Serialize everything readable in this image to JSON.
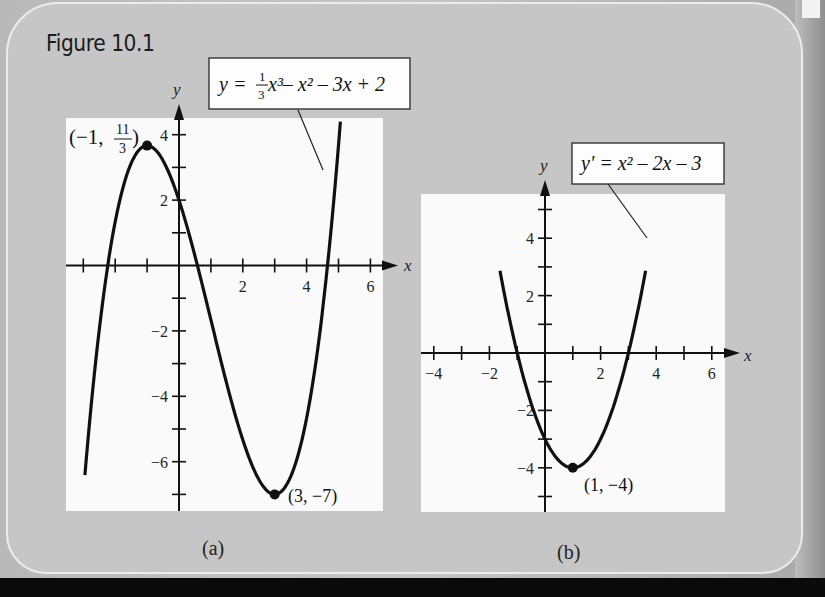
{
  "figure": {
    "title": "Figure 10.1",
    "background_color": "#c6c6c6",
    "panel_color": "#fafafa",
    "curve_color": "#111111"
  },
  "chart_data": [
    {
      "type": "line",
      "panel": "(a)",
      "title": "y = (1/3)x^3 - x^2 - 3x + 2",
      "label_box": {
        "prefix": "y = ",
        "frac_num": "1",
        "frac_den": "3",
        "rest": " x³– x² – 3x + 2"
      },
      "xlabel": "x",
      "ylabel": "y",
      "xlim": [
        -3.5,
        6.6
      ],
      "ylim": [
        -7.6,
        4.5
      ],
      "x_tick_labels": [
        "2",
        "4",
        "6"
      ],
      "y_tick_labels": [
        "4",
        "2",
        "−2",
        "−4",
        "−6"
      ],
      "x_ticks": [
        -3,
        -2,
        -1,
        1,
        2,
        3,
        4,
        5,
        6
      ],
      "y_ticks": [
        4,
        3,
        2,
        1,
        -1,
        -2,
        -3,
        -4,
        -5,
        -6,
        -7
      ],
      "grid": false,
      "function": "x^3/3 - x^2 - 3x + 2",
      "x": [
        -2.9,
        -2.5,
        -2,
        -1.5,
        -1,
        -0.5,
        0,
        0.5,
        1,
        1.5,
        2,
        2.5,
        3,
        3.5,
        4,
        4.5,
        5.05
      ],
      "y": [
        -7.2,
        -2.67,
        1.33,
        3.25,
        3.67,
        3.21,
        2,
        0.29,
        -1.67,
        -3.62,
        -5.33,
        -6.54,
        -7,
        -6.46,
        -4.67,
        -1.38,
        4.47
      ],
      "annotations": [
        {
          "label": "(−1, 11/3)",
          "label_text": "(−1,",
          "frac_num": "11",
          "frac_den": "3",
          "close": ")",
          "x": -1,
          "y": 3.667
        },
        {
          "label": "(3, −7)",
          "x": 3,
          "y": -7
        }
      ]
    },
    {
      "type": "line",
      "panel": "(b)",
      "title": "y' = x^2 - 2x - 3",
      "label_box": {
        "text": "y' = x² – 2x – 3"
      },
      "xlabel": "x",
      "ylabel": "y",
      "xlim": [
        -4.4,
        6.4
      ],
      "ylim": [
        -5.6,
        5.6
      ],
      "x_tick_labels": [
        "−4",
        "−2",
        "2",
        "4",
        "6"
      ],
      "y_tick_labels": [
        "4",
        "2",
        "−2",
        "−4"
      ],
      "x_ticks": [
        -4,
        -3,
        -2,
        -1,
        1,
        2,
        3,
        4,
        5,
        6
      ],
      "y_ticks": [
        5,
        4,
        3,
        2,
        1,
        -1,
        -2,
        -3,
        -4,
        -5
      ],
      "grid": false,
      "function": "x^2 - 2x - 3",
      "x": [
        -1.6,
        -1,
        -0.5,
        0,
        0.5,
        1,
        1.5,
        2,
        2.5,
        3,
        3.6
      ],
      "y": [
        3.76,
        0,
        -1.75,
        -3,
        -3.75,
        -4,
        -3.75,
        -3,
        -1.75,
        0,
        2.76
      ],
      "annotations": [
        {
          "label": "(1, −4)",
          "x": 1,
          "y": -4
        }
      ]
    }
  ],
  "captions": {
    "a": "(a)",
    "b": "(b)"
  }
}
